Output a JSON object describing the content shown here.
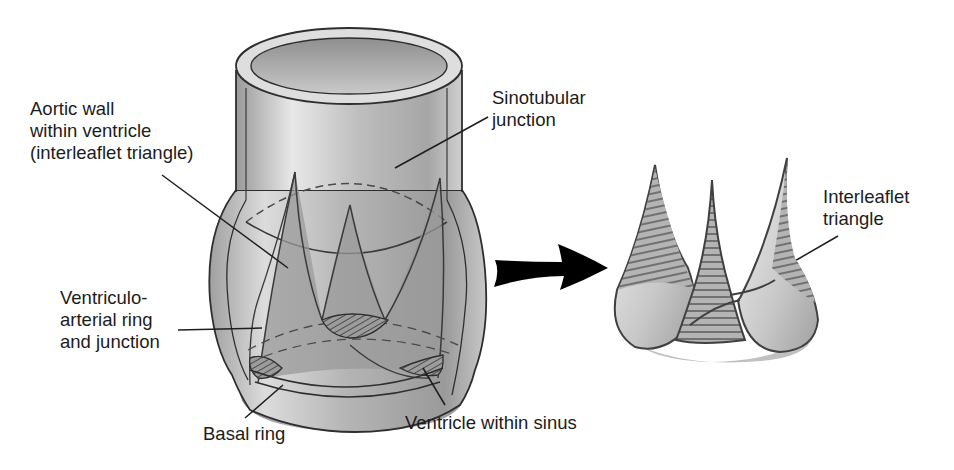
{
  "figure": {
    "labels": {
      "aortic_wall": "Aortic wall\nwithin ventricle\n(interleaflet triangle)",
      "sinotubular": "Sinotubular\njunction",
      "ventriculo_arterial": "Ventriculo-\narterial ring\nand junction",
      "basal_ring": "Basal ring",
      "ventricle_sinus": "Ventricle within sinus",
      "interleaflet": "Interleaflet\ntriangle"
    },
    "colors": {
      "outline": "#3a3a3a",
      "shade_dark": "#8c8c8c",
      "shade_light": "#e4e4e4",
      "arrow": "#000000"
    }
  }
}
